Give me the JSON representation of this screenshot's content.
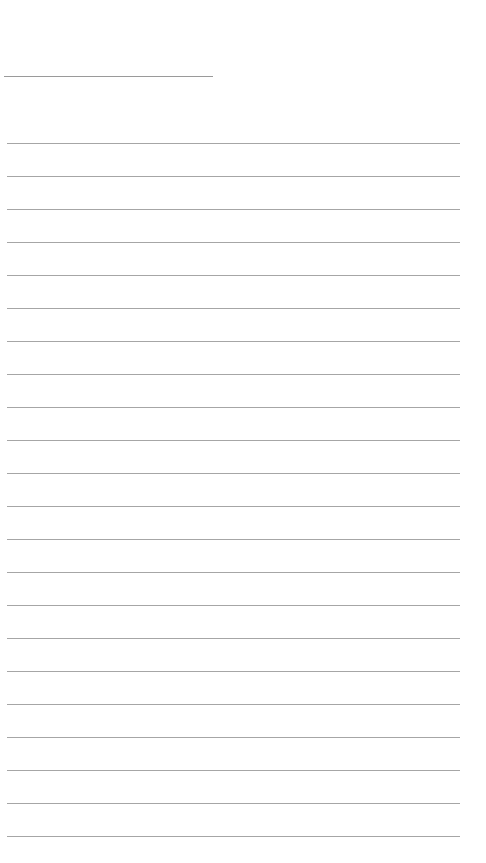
{
  "page": {
    "type": "ruled-sheet",
    "background_color": "#ffffff",
    "line_color": "#a6a6a6",
    "title_line": {
      "text": ""
    },
    "rules": [
      {
        "text": ""
      },
      {
        "text": ""
      },
      {
        "text": ""
      },
      {
        "text": ""
      },
      {
        "text": ""
      },
      {
        "text": ""
      },
      {
        "text": ""
      },
      {
        "text": ""
      },
      {
        "text": ""
      },
      {
        "text": ""
      },
      {
        "text": ""
      },
      {
        "text": ""
      },
      {
        "text": ""
      },
      {
        "text": ""
      },
      {
        "text": ""
      },
      {
        "text": ""
      },
      {
        "text": ""
      },
      {
        "text": ""
      },
      {
        "text": ""
      },
      {
        "text": ""
      },
      {
        "text": ""
      },
      {
        "text": ""
      }
    ]
  }
}
